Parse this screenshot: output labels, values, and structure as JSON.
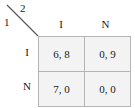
{
  "figure": {
    "type": "normal-form-game-payoff-matrix",
    "corner": {
      "row_player_label": "1",
      "col_player_label": "2",
      "diagonal": "corner-diagonal-divider"
    },
    "column_headers": [
      "I",
      "N"
    ],
    "row_headers": [
      "I",
      "N"
    ],
    "cells": [
      [
        "6, 8",
        "0, 9"
      ],
      [
        "7, 0",
        "0, 0"
      ]
    ],
    "colors": {
      "cell_fill": "#f3f3f3",
      "outer_border": "#8d8d8d",
      "inner_border": "#b5b5b5",
      "text": "#1a1a1a",
      "background": "#ffffff"
    }
  }
}
